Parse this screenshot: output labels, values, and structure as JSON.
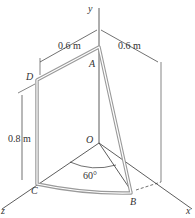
{
  "figure": {
    "axes": {
      "x": "x",
      "y": "y",
      "z": "z"
    },
    "points": {
      "origin": "O",
      "A": "A",
      "B": "B",
      "C": "C",
      "D": "D"
    },
    "dimensions": {
      "top_left": "0.6 m",
      "top_right": "0.6 m",
      "vertical": "0.8 m"
    },
    "angle": "60°"
  },
  "colors": {
    "frame": "#9a9a9a",
    "lines": "#333333"
  }
}
